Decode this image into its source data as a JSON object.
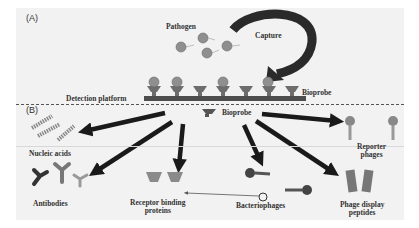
{
  "panel_a": {
    "label": "(A)",
    "pathogen_label": "Pathogen",
    "capture_label": "Capture",
    "bioprobe_label": "Bioprobe",
    "platform_label": "Detection platform"
  },
  "panel_b": {
    "label": "(B)",
    "center_label": "Bioprobe",
    "targets": [
      {
        "label": "Nucleic acids"
      },
      {
        "label": "Antibodies"
      },
      {
        "label": "Receptor binding proteins"
      },
      {
        "label": "Bacteriophages"
      },
      {
        "label": "Phage display peptides"
      },
      {
        "label": "Reporter phages"
      }
    ],
    "receptor_line1": "Receptor binding",
    "receptor_line2": "proteins",
    "phage_display_line1": "Phage display",
    "phage_display_line2": "peptides",
    "reporter_line1": "Reporter",
    "reporter_line2": "phages"
  },
  "colors": {
    "background": "#f2f2f2",
    "arrow": "#1a1a1a",
    "pathogen": "#8a8a8a",
    "platform": "#4d4d4d"
  }
}
